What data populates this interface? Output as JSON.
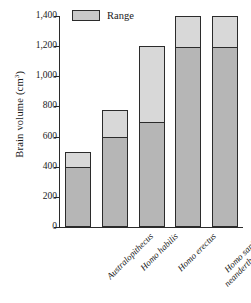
{
  "chart_data": {
    "type": "bar",
    "title": "",
    "subtitle": "",
    "xlabel": "",
    "ylabel": "Brain volume (cm",
    "ylabel_sup": "3",
    "ylabel_tail": ")",
    "categories": [
      "Australopithecus",
      "Homo habilis",
      "Homo erectus",
      "Homo sapiens neanderthalensis",
      "Homo sapiens sapiens"
    ],
    "category_lines": [
      [
        "Australopithecus"
      ],
      [
        "Homo habilis"
      ],
      [
        "Homo erectus"
      ],
      [
        "Homo sapiens",
        "neanderthalensis"
      ],
      [
        "Homo sapiens",
        "sapiens"
      ]
    ],
    "series": [
      {
        "name": "Minimum",
        "values": [
          400,
          600,
          700,
          1200,
          1200
        ]
      },
      {
        "name": "Maximum",
        "values": [
          500,
          775,
          1200,
          1400,
          1400
        ]
      }
    ],
    "ylim": [
      0,
      1400
    ],
    "yticks": [
      0,
      200,
      400,
      600,
      800,
      1000,
      1200,
      1400
    ],
    "ytick_labels": [
      "0",
      "200",
      "400",
      "600",
      "800",
      "1,000",
      "1,200",
      "1,400"
    ],
    "grid": false,
    "legend": {
      "position": "top-left",
      "entries": [
        "Range"
      ]
    },
    "colors": {
      "range_upper": "#d8d8d8",
      "range_lower": "#b6b6b6",
      "legend_swatch": "#c9c9c9",
      "outline": "#2b2b2b",
      "background": "#ffffff"
    }
  },
  "legend": {
    "label": "Range"
  }
}
